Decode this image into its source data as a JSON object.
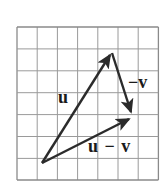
{
  "figure": {
    "background_color": "#ffffff",
    "grid": {
      "line_color": "#9a9a9a",
      "border_color": "#8a8a8a",
      "columns": 7,
      "rows": 7,
      "x_start": 17,
      "y_start": 27,
      "cell_width": 20.2,
      "cell_height": 21.9
    },
    "vector_color": "#2b2b2b",
    "vectors": [
      {
        "name": "u",
        "label": "u",
        "from": [
          42,
          163
        ],
        "to": [
          112,
          52
        ],
        "description": "vector u from origin point up and to the right"
      },
      {
        "name": "neg-v",
        "label": "−v",
        "from": [
          112,
          52
        ],
        "to": [
          133,
          117
        ],
        "description": "vector negative v from tip of u down and right"
      },
      {
        "name": "u-minus-v",
        "label": "u − v",
        "from": [
          42,
          163
        ],
        "to": [
          133,
          117
        ],
        "description": "resultant vector u minus v from origin to tip of negative v"
      }
    ]
  },
  "labels": {
    "u": "u",
    "neg_v": "−v",
    "u_minus_v": "u − v"
  }
}
